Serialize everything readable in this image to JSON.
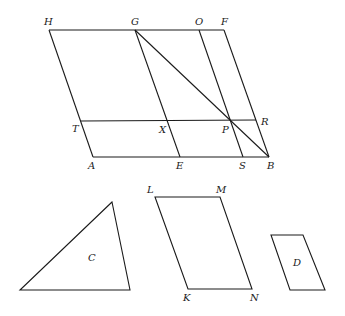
{
  "figure": {
    "main_figure": {
      "points": {
        "H": {
          "label": "H",
          "x": 49,
          "y": 30
        },
        "G": {
          "label": "G",
          "x": 135,
          "y": 30
        },
        "O": {
          "label": "O",
          "x": 199,
          "y": 30
        },
        "F": {
          "label": "F",
          "x": 224,
          "y": 30
        },
        "T": {
          "label": "T",
          "x": 81,
          "y": 121
        },
        "X": {
          "label": "X",
          "x": 167,
          "y": 121
        },
        "P": {
          "label": "P",
          "x": 230,
          "y": 120
        },
        "R": {
          "label": "R",
          "x": 256,
          "y": 120
        },
        "A": {
          "label": "A",
          "x": 93,
          "y": 157
        },
        "E": {
          "label": "E",
          "x": 180,
          "y": 157
        },
        "S": {
          "label": "S",
          "x": 243,
          "y": 157
        },
        "B": {
          "label": "B",
          "x": 269,
          "y": 157
        }
      },
      "segments": [
        "HF",
        "AB",
        "HA",
        "FB",
        "GE",
        "OS",
        "TR",
        "GB"
      ]
    },
    "triangle_C": {
      "label": "C",
      "vertices": [
        [
          112,
          202
        ],
        [
          20,
          290
        ],
        [
          130,
          290
        ]
      ]
    },
    "parallelogram_KLMN": {
      "points": {
        "L": {
          "label": "L",
          "x": 155,
          "y": 197
        },
        "M": {
          "label": "M",
          "x": 220,
          "y": 197
        },
        "N": {
          "label": "N",
          "x": 252,
          "y": 289
        },
        "K": {
          "label": "K",
          "x": 188,
          "y": 289
        }
      }
    },
    "parallelogram_D": {
      "label": "D",
      "vertices": [
        [
          271,
          235
        ],
        [
          303,
          235
        ],
        [
          325,
          290
        ],
        [
          290,
          290
        ]
      ]
    }
  }
}
